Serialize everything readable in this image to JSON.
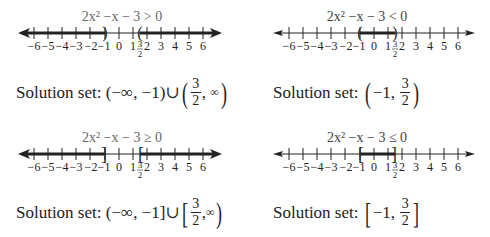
{
  "panels": [
    {
      "id": "gt",
      "inequality": "2x² −x − 3 > 0",
      "solution_label": "Solution set:",
      "left_interval": {
        "open": "(",
        "a": "−∞",
        "b": "−1",
        "close": ")"
      },
      "union": "∪",
      "right_interval": {
        "open": "(",
        "num": "3",
        "den": "2",
        "b": "∞",
        "close": ")"
      },
      "endpoints": [
        {
          "x": -1,
          "bracket": ")",
          "shade": "left"
        },
        {
          "x": 1.5,
          "bracket": "(",
          "shade": "right"
        }
      ]
    },
    {
      "id": "lt",
      "inequality": "2x² −x − 3 < 0",
      "solution_label": "Solution set:",
      "interval": {
        "open": "(",
        "a": "−1,",
        "num": "3",
        "den": "2",
        "close": ")"
      },
      "endpoints": [
        {
          "x": -1,
          "bracket": "("
        },
        {
          "x": 1.5,
          "bracket": ")"
        }
      ]
    },
    {
      "id": "ge",
      "inequality": "2x² −x − 3 ≥ 0",
      "solution_label": "Solution set:",
      "left_interval": {
        "open": "(",
        "a": "−∞",
        "b": "−1",
        "close": "]"
      },
      "union": "∪",
      "right_interval": {
        "open": "[",
        "num": "3",
        "den": "2",
        "b": "∞",
        "close": ")"
      },
      "endpoints": [
        {
          "x": -1,
          "bracket": "]",
          "shade": "left"
        },
        {
          "x": 1.5,
          "bracket": "[",
          "shade": "right"
        }
      ]
    },
    {
      "id": "le",
      "inequality": "2x² −x − 3 ≤ 0",
      "solution_label": "Solution set:",
      "interval": {
        "open": "[",
        "a": "−1,",
        "num": "3",
        "den": "2",
        "close": "]"
      },
      "endpoints": [
        {
          "x": -1,
          "bracket": "["
        },
        {
          "x": 1.5,
          "bracket": "]"
        }
      ]
    }
  ],
  "axis": {
    "ticks": [
      -6,
      -5,
      -4,
      -3,
      -2,
      -1,
      0,
      1,
      2,
      3,
      4,
      5,
      6
    ],
    "tick_labels": [
      "−6",
      "−5",
      "−4",
      "−3",
      "−2",
      "−1",
      "0",
      "1",
      "2",
      "3",
      "4",
      "5",
      "6"
    ],
    "special_label": {
      "num": "3",
      "den": "2",
      "x": 1.5
    }
  },
  "colors": {
    "text": "#222222",
    "title": "#555555",
    "line": "#222222"
  }
}
